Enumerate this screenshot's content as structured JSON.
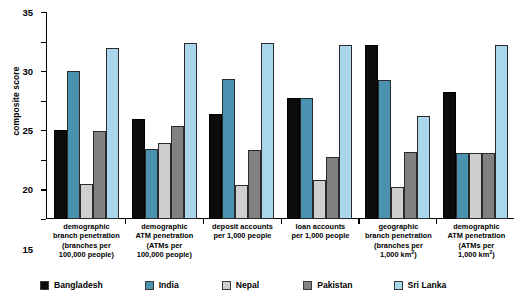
{
  "chart_data": {
    "type": "bar",
    "title": "",
    "xlabel": "",
    "ylabel": "composite score",
    "ylim": [
      0,
      35
    ],
    "yticks": [
      0,
      5,
      10,
      15,
      20,
      25,
      30,
      35
    ],
    "grid": false,
    "legend_position": "bottom",
    "categories": [
      "demographic branch penetration (branches per 100,000 people)",
      "demographic ATM penetration (ATMs per 100,000 people)",
      "deposit accounts per 1,000 people",
      "loan accounts per 1,000 people",
      "geographic branch penetration (branches per 1,000 km2)",
      "demographic ATM penetration (ATMs per 1,000 km2)"
    ],
    "category_lines": [
      [
        "demographic",
        "branch penetration",
        "(branches per",
        "100,000 people)"
      ],
      [
        "demographic",
        "ATM penetration",
        "(ATMs per",
        "100,000 people)"
      ],
      [
        "deposit accounts",
        "per 1,000 people"
      ],
      [
        "loan accounts",
        "per 1,000 people"
      ],
      [
        "geographic",
        "branch penetration",
        "(branches per",
        "1,000 km²)"
      ],
      [
        "demographic",
        "ATM penetration",
        "(ATMs per",
        "1,000 km²)"
      ]
    ],
    "series": [
      {
        "name": "Bangladesh",
        "color": "#0c0c0c",
        "values": [
          15.0,
          16.9,
          17.7,
          20.5,
          29.5,
          21.4
        ]
      },
      {
        "name": "India",
        "color": "#4a92b0",
        "values": [
          25.0,
          11.8,
          23.7,
          20.5,
          23.5,
          11.2
        ]
      },
      {
        "name": "Nepal",
        "color": "#cfcfcf",
        "values": [
          6.0,
          12.8,
          5.7,
          6.6,
          5.4,
          11.2
        ]
      },
      {
        "name": "Pakistan",
        "color": "#818181",
        "values": [
          14.9,
          15.7,
          11.6,
          10.5,
          11.4,
          11.2
        ]
      },
      {
        "name": "Sri Lanka",
        "color": "#a9d6ea",
        "values": [
          28.9,
          29.8,
          29.7,
          29.5,
          17.4,
          29.4
        ]
      }
    ]
  },
  "axis": {
    "ylabel": "composite score",
    "ticks": [
      "35",
      "30",
      "25",
      "20",
      "15",
      "10",
      "5",
      "0"
    ]
  },
  "legend": {
    "items": [
      {
        "label": "Bangladesh",
        "color": "#0c0c0c",
        "swatch": "legend-swatch-bangladesh"
      },
      {
        "label": "India",
        "color": "#4a92b0",
        "swatch": "legend-swatch-india"
      },
      {
        "label": "Nepal",
        "color": "#cfcfcf",
        "swatch": "legend-swatch-nepal"
      },
      {
        "label": "Pakistan",
        "color": "#818181",
        "swatch": "legend-swatch-pakistan"
      },
      {
        "label": "Sri Lanka",
        "color": "#a9d6ea",
        "swatch": "legend-swatch-srilanka"
      }
    ]
  }
}
